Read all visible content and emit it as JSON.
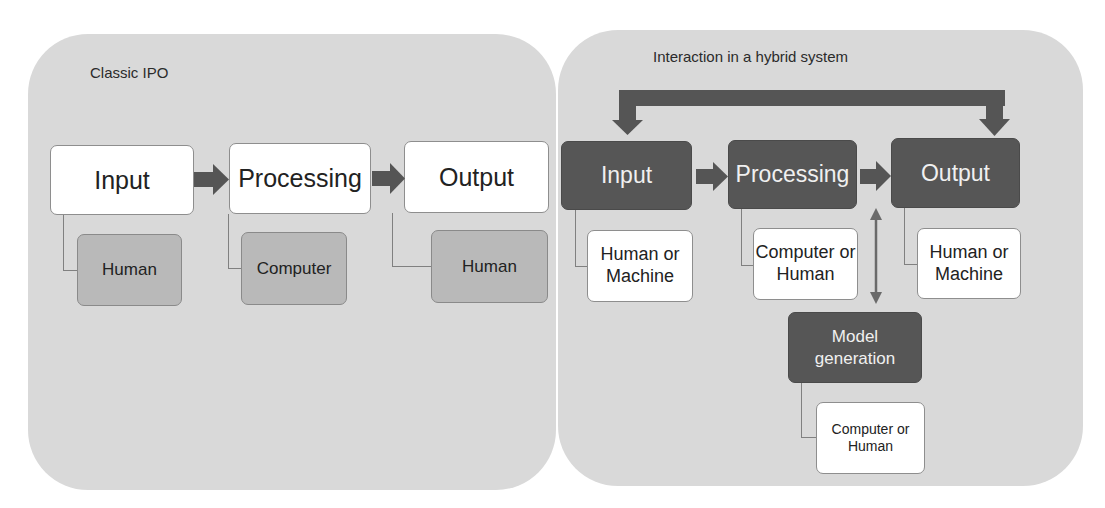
{
  "left_panel": {
    "title": "Classic IPO",
    "steps": [
      {
        "label": "Input",
        "actor": "Human"
      },
      {
        "label": "Processing",
        "actor": "Computer"
      },
      {
        "label": "Output",
        "actor": "Human"
      }
    ]
  },
  "right_panel": {
    "title": "Interaction in a hybrid system",
    "steps": [
      {
        "label": "Input",
        "actor": "Human or Machine"
      },
      {
        "label": "Processing",
        "actor": "Computer or Human"
      },
      {
        "label": "Output",
        "actor": "Human or Machine"
      }
    ],
    "model": {
      "label": "Model generation",
      "actor": "Computer or Human"
    },
    "feedback_arrow": "bidirectional-loop-input-output"
  },
  "colors": {
    "panel_bg": "#d9d9d9",
    "dark_box": "#565656",
    "gray_box": "#b9b9b9",
    "arrow": "#555555"
  }
}
